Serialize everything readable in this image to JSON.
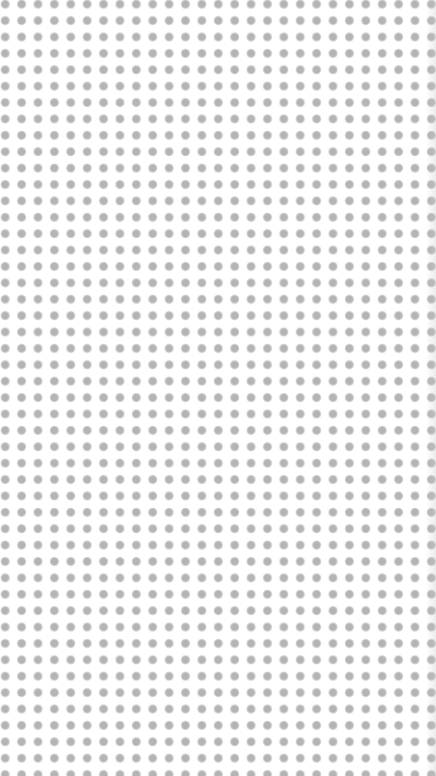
{
  "pattern": {
    "type": "dot-grid",
    "dot_color": "#b4b4b4",
    "background_color": "#ffffff",
    "pitch_px": 16.4,
    "dot_diameter_px": 8.5
  }
}
